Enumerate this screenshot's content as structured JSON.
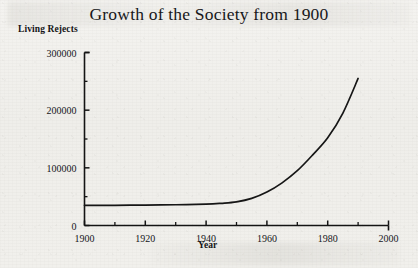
{
  "chart_data": {
    "type": "line",
    "title": "Growth of the Society from 1900",
    "xlabel": "Year",
    "ylabel": "Living Rejects",
    "xlim": [
      1900,
      2000
    ],
    "ylim": [
      0,
      300000
    ],
    "grid": false,
    "legend": false,
    "x_major_ticks": [
      1900,
      1920,
      1940,
      1960,
      1980,
      2000
    ],
    "x_minor_ticks": [
      1910,
      1930,
      1950,
      1970,
      1990
    ],
    "x_tick_labels": [
      "1900",
      "1920",
      "1940",
      "1960",
      "1980",
      "2000"
    ],
    "y_major_ticks": [
      0,
      100000,
      200000,
      300000
    ],
    "y_minor_ticks": [
      50000,
      150000,
      250000
    ],
    "y_tick_labels": [
      "0",
      "100000",
      "200000",
      "300000"
    ],
    "series": [
      {
        "name": "Living Rejects",
        "color": "#161616",
        "x": [
          1900,
          1910,
          1920,
          1930,
          1940,
          1945,
          1950,
          1955,
          1960,
          1965,
          1970,
          1975,
          1980,
          1985,
          1990
        ],
        "values": [
          35000,
          35000,
          35500,
          36000,
          37000,
          38500,
          41000,
          47000,
          58000,
          74000,
          95000,
          122000,
          152000,
          195000,
          255000
        ]
      }
    ]
  }
}
